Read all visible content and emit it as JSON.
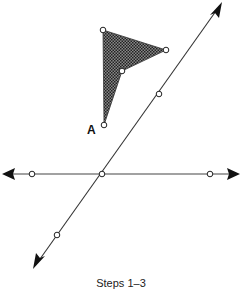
{
  "diagram": {
    "caption": "Steps 1–3",
    "point_label": "A",
    "colors": {
      "line": "#333333",
      "fill_pattern": "#444444",
      "point_fill": "#ffffff"
    },
    "horizontal_line": {
      "x1": 3,
      "y1": 174,
      "x2": 239,
      "y2": 174,
      "arrows": "both"
    },
    "diagonal_line": {
      "x1": 34,
      "y1": 268,
      "x2": 222,
      "y2": 2,
      "arrows": "both"
    },
    "points_on_horizontal": [
      {
        "x": 32,
        "y": 174
      },
      {
        "x": 102,
        "y": 174
      },
      {
        "x": 210,
        "y": 174
      }
    ],
    "points_on_diagonal": [
      {
        "x": 159,
        "y": 94
      },
      {
        "x": 57,
        "y": 235
      }
    ],
    "shaded_shape": {
      "vertices": [
        {
          "x": 103,
          "y": 30
        },
        {
          "x": 166,
          "y": 50
        },
        {
          "x": 122,
          "y": 71
        },
        {
          "x": 104,
          "y": 125
        }
      ]
    }
  }
}
